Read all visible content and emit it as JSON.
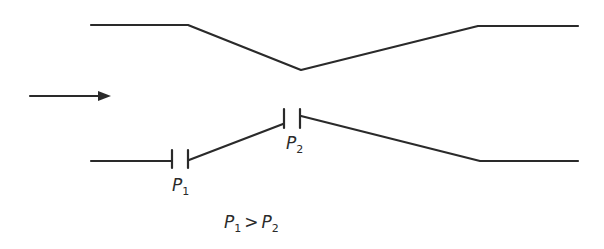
{
  "diagram": {
    "type": "venturi-tube",
    "flow_direction": "left-to-right",
    "labels": {
      "p1_base": "P",
      "p1_sub": "1",
      "p2_base": "P",
      "p2_sub": "2",
      "relation_lhs_base": "P",
      "relation_lhs_sub": "1",
      "relation_op": ">",
      "relation_rhs_base": "P",
      "relation_rhs_sub": "2"
    },
    "colors": {
      "line": "#2a2a2a",
      "background": "#ffffff"
    }
  }
}
